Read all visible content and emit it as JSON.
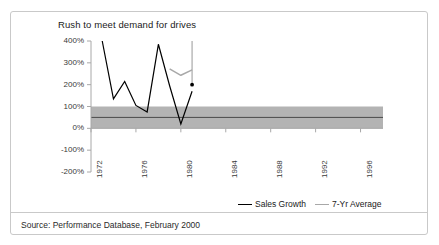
{
  "figure": {
    "title": "Rush to meet demand for drives",
    "source_note": "Source: Performance Database, February 2000",
    "frame_color": "#c9c9c9",
    "background": "#ffffff"
  },
  "legend": {
    "position": "bottom-right",
    "entries": [
      {
        "label": "Sales Growth",
        "color": "#000000"
      },
      {
        "label": "7-Yr Average",
        "color": "#a8a8a8"
      }
    ]
  },
  "chart_data": {
    "type": "line",
    "title": "Rush to meet demand for drives",
    "xlabel": "",
    "ylabel": "",
    "grid": false,
    "xlim": [
      1972,
      1998
    ],
    "ylim": [
      -200,
      400
    ],
    "ytick_labels": [
      "400%",
      "300%",
      "200%",
      "100%",
      "0%",
      "-100%",
      "-200%"
    ],
    "ytick_values": [
      400,
      300,
      200,
      100,
      0,
      -100,
      -200
    ],
    "xtick_labels": [
      "1972",
      "1976",
      "1980",
      "1984",
      "1988",
      "1992",
      "1996"
    ],
    "xtick_values": [
      1972,
      1976,
      1980,
      1984,
      1988,
      1992,
      1996
    ],
    "series": [
      {
        "name": "Sales Growth",
        "color": "#000000",
        "x": [
          1973,
          1974,
          1975,
          1976,
          1977,
          1978,
          1979,
          1980,
          1981
        ],
        "values": [
          400,
          135,
          215,
          105,
          75,
          385,
          195,
          20,
          170
        ]
      },
      {
        "name": "7-Yr Average",
        "color": "#a8a8a8",
        "x": [
          1979,
          1980,
          1981
        ],
        "values": [
          272,
          243,
          268
        ]
      }
    ],
    "bands": [
      {
        "name": "normal-range-band",
        "color": "#b3b3b3",
        "y_low": 0,
        "y_high": 100,
        "x_start": 1972,
        "x_end": 1998
      }
    ],
    "annotations": [
      {
        "name": "marker-dot",
        "x": 1981,
        "y": 200,
        "color": "#000000"
      },
      {
        "name": "callout-rule",
        "x": 1981,
        "y_top": 400,
        "y_bottom": 200,
        "color": "#8c8c8c"
      },
      {
        "name": "band-center-line",
        "y": 50,
        "color": "#4a4a4a"
      }
    ]
  }
}
